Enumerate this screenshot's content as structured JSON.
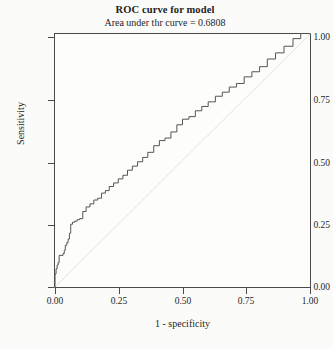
{
  "chart_data": {
    "type": "line",
    "title": "ROC curve for model",
    "subtitle": "Area under thr curve = 0.6808",
    "auc": 0.6808,
    "xlabel": "1 - specificity",
    "ylabel": "Sensitivity",
    "xlim": [
      0,
      1
    ],
    "ylim": [
      0,
      1
    ],
    "grid": false,
    "legend": "none",
    "xticks": [
      "0.00",
      "0.25",
      "0.50",
      "0.75",
      "1.00"
    ],
    "xtick_values": [
      0,
      0.25,
      0.5,
      0.75,
      1
    ],
    "yticks": [
      "0.00",
      "0.25",
      "0.50",
      "0.75",
      "1.00"
    ],
    "ytick_values": [
      0,
      0.25,
      0.5,
      0.75,
      1
    ],
    "series": [
      {
        "name": "ROC curve",
        "style": "step",
        "color": "#555555",
        "x": [
          0.0,
          0.004,
          0.004,
          0.008,
          0.008,
          0.012,
          0.012,
          0.016,
          0.016,
          0.02,
          0.02,
          0.035,
          0.035,
          0.04,
          0.04,
          0.044,
          0.044,
          0.05,
          0.05,
          0.055,
          0.055,
          0.06,
          0.06,
          0.065,
          0.065,
          0.072,
          0.072,
          0.08,
          0.08,
          0.09,
          0.09,
          0.1,
          0.1,
          0.112,
          0.112,
          0.125,
          0.125,
          0.14,
          0.14,
          0.155,
          0.155,
          0.17,
          0.17,
          0.185,
          0.185,
          0.2,
          0.2,
          0.215,
          0.215,
          0.232,
          0.232,
          0.25,
          0.25,
          0.268,
          0.268,
          0.286,
          0.286,
          0.305,
          0.305,
          0.325,
          0.325,
          0.345,
          0.345,
          0.365,
          0.365,
          0.388,
          0.388,
          0.41,
          0.41,
          0.432,
          0.432,
          0.455,
          0.455,
          0.478,
          0.478,
          0.5,
          0.5,
          0.525,
          0.525,
          0.55,
          0.55,
          0.575,
          0.575,
          0.6,
          0.6,
          0.628,
          0.628,
          0.655,
          0.655,
          0.682,
          0.682,
          0.71,
          0.71,
          0.74,
          0.74,
          0.77,
          0.77,
          0.8,
          0.8,
          0.83,
          0.83,
          0.862,
          0.862,
          0.895,
          0.895,
          0.93,
          0.93,
          0.96,
          0.96,
          1.0
        ],
        "y": [
          0.0,
          0.0,
          0.055,
          0.055,
          0.075,
          0.075,
          0.09,
          0.09,
          0.1,
          0.1,
          0.128,
          0.128,
          0.135,
          0.135,
          0.148,
          0.148,
          0.168,
          0.168,
          0.178,
          0.178,
          0.192,
          0.192,
          0.215,
          0.215,
          0.25,
          0.25,
          0.258,
          0.258,
          0.262,
          0.262,
          0.268,
          0.268,
          0.272,
          0.272,
          0.3,
          0.3,
          0.318,
          0.318,
          0.33,
          0.33,
          0.345,
          0.345,
          0.352,
          0.352,
          0.372,
          0.372,
          0.382,
          0.382,
          0.398,
          0.398,
          0.412,
          0.412,
          0.428,
          0.428,
          0.442,
          0.442,
          0.462,
          0.462,
          0.478,
          0.478,
          0.495,
          0.495,
          0.512,
          0.512,
          0.532,
          0.532,
          0.558,
          0.558,
          0.578,
          0.578,
          0.588,
          0.588,
          0.612,
          0.612,
          0.64,
          0.64,
          0.662,
          0.662,
          0.672,
          0.672,
          0.695,
          0.695,
          0.712,
          0.712,
          0.73,
          0.73,
          0.752,
          0.752,
          0.768,
          0.768,
          0.788,
          0.788,
          0.802,
          0.802,
          0.828,
          0.828,
          0.848,
          0.848,
          0.868,
          0.868,
          0.898,
          0.898,
          0.922,
          0.922,
          0.948,
          0.948,
          0.978,
          0.978,
          1.0,
          1.0
        ]
      },
      {
        "name": "reference diagonal",
        "style": "line",
        "color": "#e2e2e2",
        "x": [
          0,
          1
        ],
        "y": [
          0,
          1
        ]
      }
    ]
  },
  "figure": {
    "title": "ROC curve for model",
    "subtitle": "Area under thr curve = 0.6808",
    "xlabel": "1 - specificity",
    "ylabel": "Sensitivity",
    "xticks": [
      "0.00",
      "0.25",
      "0.50",
      "0.75",
      "1.00"
    ],
    "yticks": [
      "0.00",
      "0.25",
      "0.50",
      "0.75",
      "1.00"
    ]
  }
}
